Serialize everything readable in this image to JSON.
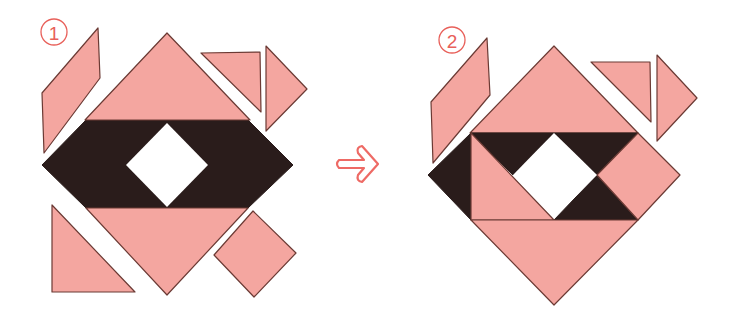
{
  "figure": {
    "panels": [
      {
        "id": "step-1",
        "label": "1",
        "label_glyph": "①"
      },
      {
        "id": "step-2",
        "label": "2",
        "label_glyph": "②"
      }
    ],
    "arrow": {
      "direction": "right",
      "icon": "arrow-right-icon"
    },
    "colors": {
      "piece_fill": "#f4a6a0",
      "piece_stroke": "#6b3a34",
      "dark_fill": "#2a1c1b",
      "label_color": "#e8605a",
      "arrow_color": "#ee6a65",
      "background": "#ffffff"
    }
  }
}
